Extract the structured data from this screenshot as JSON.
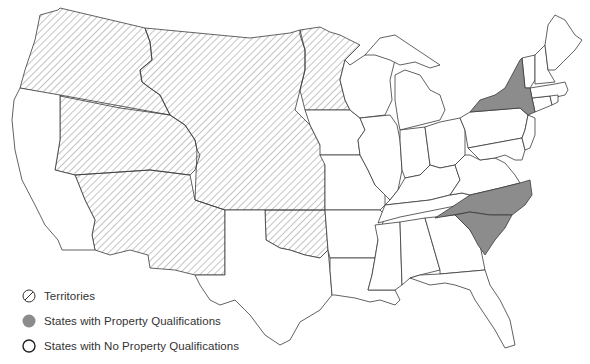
{
  "map": {
    "title": "",
    "region": "United States",
    "legend": [
      {
        "key": "territories",
        "label": "Territories",
        "symbol": "hatched-circle"
      },
      {
        "key": "property",
        "label": "States with Property Qualifications",
        "symbol": "gray-filled-circle",
        "color": "#8c8c8c"
      },
      {
        "key": "noproperty",
        "label": "States with No Property Qualifications",
        "symbol": "open-circle",
        "color": "#ffffff"
      }
    ],
    "categories": {
      "territories": [
        "Oregon Territory",
        "Washington area",
        "Utah Territory",
        "New Mexico Territory",
        "Nebraska/Dakota region",
        "Kansas region",
        "Minnesota area",
        "Indian Territory"
      ],
      "states_with_property_qualifications": [
        "New York",
        "North Carolina",
        "South Carolina"
      ],
      "states_with_no_property_qualifications": [
        "California",
        "Texas",
        "Iowa",
        "Missouri",
        "Arkansas",
        "Louisiana",
        "Wisconsin",
        "Illinois",
        "Michigan",
        "Indiana",
        "Ohio",
        "Kentucky",
        "Tennessee",
        "Mississippi",
        "Alabama",
        "Georgia",
        "Florida",
        "Pennsylvania",
        "Virginia",
        "Maryland",
        "Delaware",
        "New Jersey",
        "Connecticut",
        "Rhode Island",
        "Massachusetts",
        "Vermont",
        "New Hampshire",
        "Maine"
      ]
    },
    "colors": {
      "property_fill": "#8c8c8c",
      "outline": "#3a3a3a",
      "hatch": "#555555"
    }
  }
}
